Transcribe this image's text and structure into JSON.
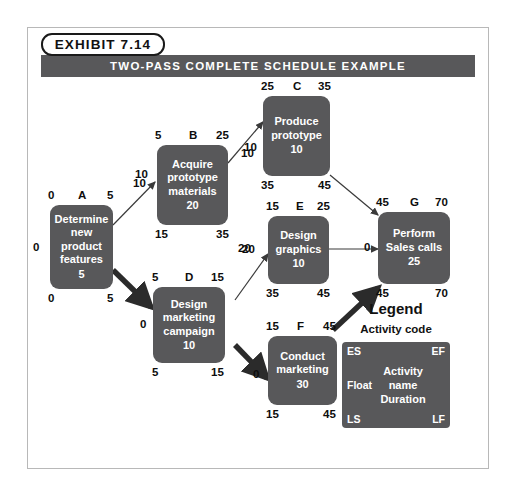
{
  "exhibit": {
    "tag": "EXHIBIT 7.14",
    "title": "TWO-PASS COMPLETE SCHEDULE EXAMPLE"
  },
  "colors": {
    "node_fill": "#58585a",
    "banner": "#58585a",
    "text_dark": "#0d0d0d",
    "frame": "#b8b8b8"
  },
  "legend": {
    "heading": "Legend",
    "subheading": "Activity code",
    "es": "ES",
    "ef": "EF",
    "float": "Float",
    "ls": "LS",
    "lf": "LF",
    "center_line1": "Activity",
    "center_line2": "name",
    "center_line3": "Duration"
  },
  "nodes": [
    {
      "id": "A",
      "name_lines": [
        "Determine",
        "new",
        "product",
        "features"
      ],
      "duration": "5",
      "es": "0",
      "ef": "5",
      "ls": "0",
      "lf": "5",
      "float": "0",
      "critical": true
    },
    {
      "id": "B",
      "name_lines": [
        "Acquire",
        "prototype",
        "materials"
      ],
      "duration": "20",
      "es": "5",
      "ef": "25",
      "ls": "15",
      "lf": "35",
      "float": "10",
      "critical": false
    },
    {
      "id": "C",
      "name_lines": [
        "Produce",
        "prototype"
      ],
      "duration": "10",
      "es": "25",
      "ef": "35",
      "ls": "35",
      "lf": "45",
      "float": "10",
      "critical": false
    },
    {
      "id": "D",
      "name_lines": [
        "Design",
        "marketing",
        "campaign"
      ],
      "duration": "10",
      "es": "5",
      "ef": "15",
      "ls": "5",
      "lf": "15",
      "float": "0",
      "critical": true
    },
    {
      "id": "E",
      "name_lines": [
        "Design",
        "graphics"
      ],
      "duration": "10",
      "es": "15",
      "ef": "25",
      "ls": "35",
      "lf": "45",
      "float": "20",
      "critical": false
    },
    {
      "id": "F",
      "name_lines": [
        "Conduct",
        "marketing"
      ],
      "duration": "30",
      "es": "15",
      "ef": "45",
      "ls": "15",
      "lf": "45",
      "float": "0",
      "critical": true
    },
    {
      "id": "G",
      "name_lines": [
        "Perform",
        "Sales calls"
      ],
      "duration": "25",
      "es": "45",
      "ef": "70",
      "ls": "45",
      "lf": "70",
      "float": "0",
      "critical": true
    }
  ],
  "edges": [
    {
      "from": "A",
      "to": "B",
      "label": "10",
      "critical": false
    },
    {
      "from": "A",
      "to": "D",
      "label": "0",
      "critical": true
    },
    {
      "from": "B",
      "to": "C",
      "label": "10",
      "critical": false
    },
    {
      "from": "D",
      "to": "E",
      "label": "20",
      "critical": false
    },
    {
      "from": "D",
      "to": "F",
      "label": "0",
      "critical": true
    },
    {
      "from": "C",
      "to": "G",
      "label": "",
      "critical": false
    },
    {
      "from": "E",
      "to": "G",
      "label": "0",
      "critical": false
    },
    {
      "from": "F",
      "to": "G",
      "label": "",
      "critical": true
    }
  ]
}
